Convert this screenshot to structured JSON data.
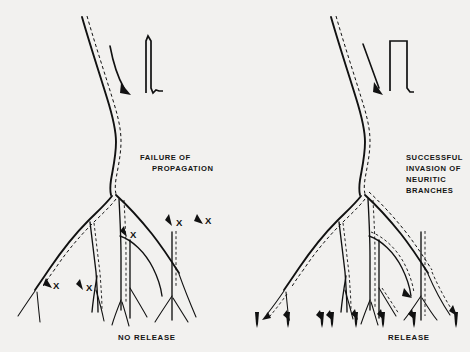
{
  "figure": {
    "background_color": "#f2f1ef",
    "ink_color": "#111111",
    "panels": [
      {
        "id": "left",
        "title_lines": [
          "FAILURE  OF",
          "PROPAGATION"
        ],
        "caption": "NO RELEASE",
        "stimulus_waveform": "narrow-spike",
        "conduction_arrow": "curved-down-arrow",
        "block_marker_label": "X",
        "block_marker_count": 5,
        "release_arrow_count": 0
      },
      {
        "id": "right",
        "title_lines": [
          "SUCCESSFUL",
          "INVASION  OF",
          "NEURITIC",
          "BRANCHES"
        ],
        "caption": "RELEASE",
        "stimulus_waveform": "square-pulse",
        "conduction_arrow": "straight-down-arrow",
        "block_marker_label": "X",
        "block_marker_count": 0,
        "release_arrow_count": 8
      }
    ],
    "block_markers_left": [
      {
        "label": "X",
        "x": 205,
        "y": 224
      },
      {
        "label": "X",
        "x": 130,
        "y": 236
      },
      {
        "label": "X",
        "x": 53,
        "y": 287
      },
      {
        "label": "X",
        "x": 86,
        "y": 289
      },
      {
        "label": "X",
        "x": 176,
        "y": 225
      }
    ],
    "release_arrows_right": [
      {
        "x": 257,
        "y": 322
      },
      {
        "x": 288,
        "y": 322
      },
      {
        "x": 322,
        "y": 322
      },
      {
        "x": 332,
        "y": 322
      },
      {
        "x": 356,
        "y": 322
      },
      {
        "x": 383,
        "y": 322
      },
      {
        "x": 414,
        "y": 322
      },
      {
        "x": 456,
        "y": 322
      }
    ]
  }
}
